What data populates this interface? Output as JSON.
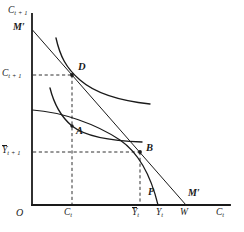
{
  "figure": {
    "background_color": "#ffffff",
    "line_color": "#1a1a1a",
    "width": 244,
    "height": 232
  },
  "axes": {
    "origin_label": "O",
    "y_axis_label_base": "C",
    "y_axis_label_sub": "t + 1",
    "x_axis_label_base": "C",
    "x_axis_label_sub": "t",
    "x_axis_y_px": 205,
    "y_axis_x_px": 32,
    "x_axis_end_px": 230,
    "y_axis_top_px": 14
  },
  "y_ticks": [
    {
      "id": "c-t-plus-1",
      "base": "C",
      "sub": "t + 1",
      "overbar": false,
      "y_px": 75,
      "label_x_px": 2
    },
    {
      "id": "y-bar-t-plus-1",
      "base": "Y",
      "sub": "t + 1",
      "overbar": true,
      "y_px": 152,
      "label_x_px": 2
    }
  ],
  "x_ticks": [
    {
      "id": "c-t",
      "base": "C",
      "sub": "t",
      "overbar": false,
      "x_px": 72,
      "label_y_px": 210
    },
    {
      "id": "y-bar-t",
      "base": "Y",
      "sub": "t",
      "overbar": true,
      "x_px": 140,
      "label_y_px": 210
    },
    {
      "id": "y-t",
      "base": "Y",
      "sub": "t",
      "overbar": false,
      "x_px": 163,
      "label_y_px": 210
    },
    {
      "id": "w",
      "base": "W",
      "sub": "",
      "overbar": false,
      "x_px": 186,
      "label_y_px": 210
    }
  ],
  "points": [
    {
      "id": "D",
      "label": "D",
      "x_px": 72,
      "y_px": 75,
      "label_x_px": 78,
      "label_y_px": 64,
      "description": "Tangency of higher indifference curve with budget line M'M'"
    },
    {
      "id": "A",
      "label": "A",
      "x_px": 72,
      "y_px": 126,
      "label_x_px": 76,
      "label_y_px": 126,
      "description": "Tangency of lower indifference curve with production possibility curve"
    },
    {
      "id": "B",
      "label": "B",
      "x_px": 140,
      "y_px": 152,
      "label_x_px": 146,
      "label_y_px": 142,
      "description": "Production point where budget line is tangent to PP curve"
    }
  ],
  "curve_labels": [
    {
      "id": "m-prime-top",
      "text": "M′",
      "x_px": 14,
      "y_px": 26,
      "description": "Upper endpoint label of the wealth/budget line"
    },
    {
      "id": "m-prime-bottom",
      "text": "M′",
      "x_px": 190,
      "y_px": 192,
      "description": "Lower endpoint label of the wealth/budget line"
    },
    {
      "id": "p-curve",
      "text": "P",
      "x_px": 150,
      "y_px": 190,
      "description": "Production possibility frontier label"
    }
  ],
  "curves": {
    "budget_line": {
      "name": "M'M' budget line",
      "from_px": [
        32,
        30
      ],
      "to_px": [
        186,
        205
      ]
    },
    "production_frontier": {
      "name": "PP production possibility curve",
      "from_px": [
        32,
        110
      ],
      "to_px": [
        160,
        205
      ]
    },
    "indifference_high": {
      "name": "Higher indifference curve through D",
      "tangent_point_px": [
        72,
        75
      ]
    },
    "indifference_low": {
      "name": "Lower indifference curve through A",
      "tangent_point_px": [
        72,
        126
      ]
    }
  },
  "dashed_guides": [
    {
      "id": "guide-d-horizontal",
      "from_px": [
        32,
        75
      ],
      "to_px": [
        72,
        75
      ]
    },
    {
      "id": "guide-d-vertical",
      "from_px": [
        72,
        75
      ],
      "to_px": [
        72,
        205
      ]
    },
    {
      "id": "guide-b-horizontal",
      "from_px": [
        32,
        152
      ],
      "to_px": [
        140,
        152
      ]
    },
    {
      "id": "guide-b-vertical",
      "from_px": [
        140,
        152
      ],
      "to_px": [
        140,
        205
      ]
    }
  ]
}
